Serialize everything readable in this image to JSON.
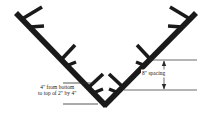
{
  "figure": {
    "background_color": "#ffffff",
    "line_color": "#1a1a1a",
    "text_color": "#151515"
  },
  "annotations": {
    "left_note": {
      "line1": "4\" from bottom",
      "line2": "to top of 2\" by 4\""
    },
    "right_note": {
      "text": "8\" spacing"
    }
  },
  "geometry": {
    "vertex": {
      "x": 105,
      "y": 105
    },
    "left_arm_end": {
      "x": 16,
      "y": 13
    },
    "right_arm_end": {
      "x": 196,
      "y": 13
    },
    "beam_width": 5.5,
    "left_pegs": 3,
    "right_pegs": 3,
    "dimension_top_y": 60,
    "dimension_bottom_y": 90,
    "dimension_x": 164
  }
}
